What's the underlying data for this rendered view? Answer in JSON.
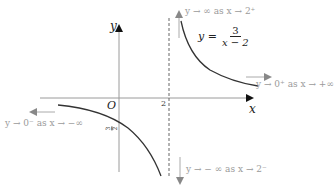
{
  "diagram": {
    "function": "y = 3/(x-2)",
    "equation": {
      "lhs": "y =",
      "numerator": "3",
      "denominator": "x − 2"
    },
    "axes": {
      "x_label": "x",
      "y_label": "y",
      "origin_label": "O"
    },
    "ticks": {
      "x_tick": "2",
      "y_intercept": {
        "numerator": "3",
        "denominator": "2",
        "sign": "−"
      }
    },
    "asymptote": {
      "vertical": "x = 2",
      "style": "dashed"
    },
    "annotations": {
      "top_right": "y → ∞ as x → 2⁺",
      "right": "y → 0⁺ as x → +∞",
      "left": "y → 0⁻ as x → −∞",
      "bottom": "y → − ∞ as x → 2⁻"
    },
    "colors": {
      "curve": "#333333",
      "axis": "#9a9a9a",
      "annotation": "#9a9a9a",
      "arrow": "#8a8a8a"
    }
  }
}
